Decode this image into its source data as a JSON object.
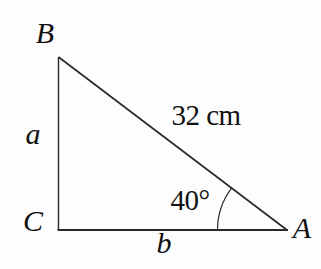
{
  "figure": {
    "type": "right-triangle-diagram",
    "vertices": {
      "top_left": {
        "label": "B"
      },
      "bottom_left": {
        "label": "C"
      },
      "bottom_right": {
        "label": "A"
      }
    },
    "sides": {
      "left": {
        "label": "a"
      },
      "bottom": {
        "label": "b"
      },
      "hypotenuse": {
        "label": "32 cm"
      }
    },
    "angle": {
      "at_vertex": "A",
      "label": "40°"
    },
    "colors": {
      "line": "#2a2a2a",
      "text": "#111111",
      "background": "#fdfdfd"
    }
  }
}
